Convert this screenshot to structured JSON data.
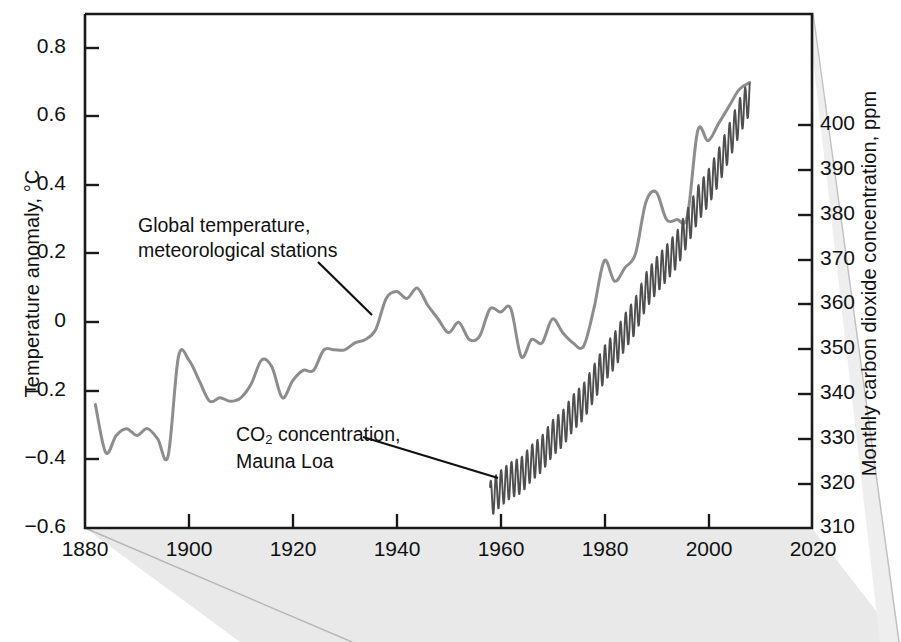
{
  "figure": {
    "background_color": "#ffffff",
    "page_shade_color": "#e8e8e8",
    "frame_color": "#1a1a1a"
  },
  "axes": {
    "x": {
      "label": "",
      "ticks": [
        "1880",
        "1900",
        "1920",
        "1940",
        "1960",
        "1980",
        "2000",
        "2020"
      ],
      "range": [
        1880,
        2020
      ]
    },
    "y_left": {
      "label": "Temperature anomaly, °C",
      "ticks": [
        "0.8",
        "0.6",
        "0.4",
        "0.2",
        "0",
        "−0.2",
        "−0.4",
        "−0.6"
      ],
      "range": [
        -0.6,
        0.9
      ]
    },
    "y_right": {
      "label": "Monthly carbon dioxide concentration, ppm",
      "ticks": [
        "400",
        "390",
        "380",
        "370",
        "360",
        "350",
        "340",
        "330",
        "320",
        "310"
      ],
      "range": [
        310,
        400
      ]
    }
  },
  "annotations": [
    {
      "id": "temperature-annotation",
      "line1": "Global temperature,",
      "line2": "meteorological stations"
    },
    {
      "id": "co2-annotation",
      "line1_pre": "CO",
      "line1_sub": "2",
      "line1_post": " concentration,",
      "line2": "Mauna Loa"
    }
  ],
  "chart_data": {
    "type": "line",
    "title": "",
    "xlabel": "",
    "ylabel": "Temperature anomaly, °C",
    "ylabel_right": "Monthly carbon dioxide concentration, ppm",
    "xlim": [
      1880,
      2020
    ],
    "ylim": [
      -0.6,
      0.9
    ],
    "ylim_right": [
      310,
      400
    ],
    "grid": false,
    "legend": "annotations-inline",
    "series": [
      {
        "name": "Global temperature, meteorological stations",
        "axis": "left",
        "units": "°C",
        "color": "#8d8d8d",
        "x": [
          1882,
          1884,
          1886,
          1888,
          1890,
          1892,
          1894,
          1896,
          1898,
          1900,
          1902,
          1904,
          1906,
          1908,
          1910,
          1912,
          1914,
          1916,
          1918,
          1920,
          1922,
          1924,
          1926,
          1928,
          1930,
          1932,
          1934,
          1936,
          1938,
          1940,
          1942,
          1944,
          1946,
          1948,
          1950,
          1952,
          1954,
          1956,
          1958,
          1960,
          1962,
          1964,
          1966,
          1968,
          1970,
          1972,
          1974,
          1976,
          1978,
          1980,
          1982,
          1984,
          1986,
          1988,
          1990,
          1992,
          1994,
          1996,
          1998,
          2000,
          2002,
          2004,
          2006,
          2008
        ],
        "y": [
          -0.24,
          -0.38,
          -0.33,
          -0.31,
          -0.33,
          -0.31,
          -0.34,
          -0.39,
          -0.1,
          -0.11,
          -0.17,
          -0.23,
          -0.22,
          -0.23,
          -0.22,
          -0.18,
          -0.11,
          -0.13,
          -0.22,
          -0.17,
          -0.14,
          -0.14,
          -0.08,
          -0.08,
          -0.08,
          -0.06,
          -0.05,
          -0.02,
          0.07,
          0.09,
          0.07,
          0.1,
          0.05,
          0.01,
          -0.03,
          0.0,
          -0.05,
          -0.04,
          0.04,
          0.03,
          0.04,
          -0.1,
          -0.05,
          -0.06,
          0.01,
          -0.03,
          -0.06,
          -0.07,
          0.04,
          0.18,
          0.12,
          0.16,
          0.2,
          0.35,
          0.38,
          0.3,
          0.3,
          0.31,
          0.56,
          0.53,
          0.58,
          0.63,
          0.68,
          0.7
        ]
      },
      {
        "name": "CO2 concentration, Mauna Loa",
        "axis": "right",
        "units": "ppm",
        "color": "#4f4f4f",
        "seasonal_cycle_amplitude_ppm": 3.2,
        "x": [
          1958,
          1960,
          1962,
          1964,
          1966,
          1968,
          1970,
          1972,
          1974,
          1976,
          1978,
          1980,
          1982,
          1984,
          1986,
          1988,
          1990,
          1992,
          1994,
          1996,
          1998,
          2000,
          2002,
          2004,
          2006,
          2008
        ],
        "y": [
          315,
          316.9,
          318.4,
          319.2,
          321.4,
          323.0,
          325.7,
          327.4,
          330.2,
          332.1,
          335.4,
          338.7,
          341.1,
          344.4,
          347.2,
          351.5,
          354.2,
          356.4,
          358.8,
          362.6,
          366.7,
          369.5,
          373.2,
          377.5,
          381.9,
          385.6
        ]
      }
    ]
  }
}
